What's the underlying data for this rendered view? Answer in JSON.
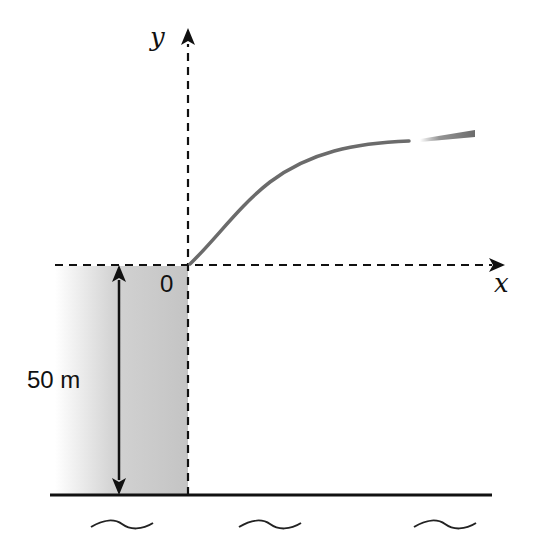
{
  "diagram": {
    "type": "projectile-from-cliff",
    "axes": {
      "x_label": "x",
      "y_label": "y",
      "origin_label": "0"
    },
    "cliff": {
      "height_label": "50 m"
    },
    "trajectory": {
      "description": "curved path rising from origin, leveling off to the right, ending in a tapered motion-blur segment"
    },
    "ground": {
      "water_symbols": [
        "~",
        "~",
        "~"
      ]
    },
    "colors": {
      "cliff_fill": "#c8c8c8",
      "trajectory": "#6b6b6b",
      "axes": "#111111",
      "ground": "#111111"
    }
  }
}
